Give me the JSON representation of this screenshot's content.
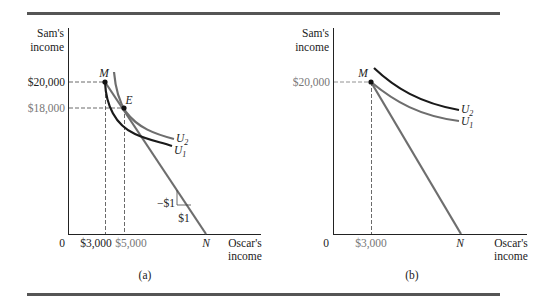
{
  "figure": {
    "panels": [
      {
        "id": "a",
        "caption": "(a)",
        "y_axis_label_line1": "Sam's",
        "y_axis_label_line2": "income",
        "x_axis_label_line1": "Oscar's",
        "x_axis_label_line2": "income",
        "origin_label": "0",
        "y_ticks": [
          "$20,000",
          "$18,000"
        ],
        "x_ticks": [
          "$3,000",
          "$5,000"
        ],
        "points": [
          "M",
          "E"
        ],
        "endpoint": "N",
        "curves": [
          "U",
          "U"
        ],
        "curve_subscripts": [
          "2",
          "1"
        ],
        "slope_rise": "−$1",
        "slope_run": "$1"
      },
      {
        "id": "b",
        "caption": "(b)",
        "y_axis_label_line1": "Sam's",
        "y_axis_label_line2": "income",
        "x_axis_label_line1": "Oscar's",
        "x_axis_label_line2": "income",
        "origin_label": "0",
        "y_ticks": [
          "$20,000"
        ],
        "x_ticks": [
          "$3,000"
        ],
        "points": [
          "M"
        ],
        "endpoint": "N",
        "curves": [
          "U",
          "U"
        ],
        "curve_subscripts": [
          "2",
          "1"
        ]
      }
    ],
    "colors": {
      "black": "#1a1a1a",
      "gray": "#6e6e6e",
      "rule": "#555555"
    }
  }
}
